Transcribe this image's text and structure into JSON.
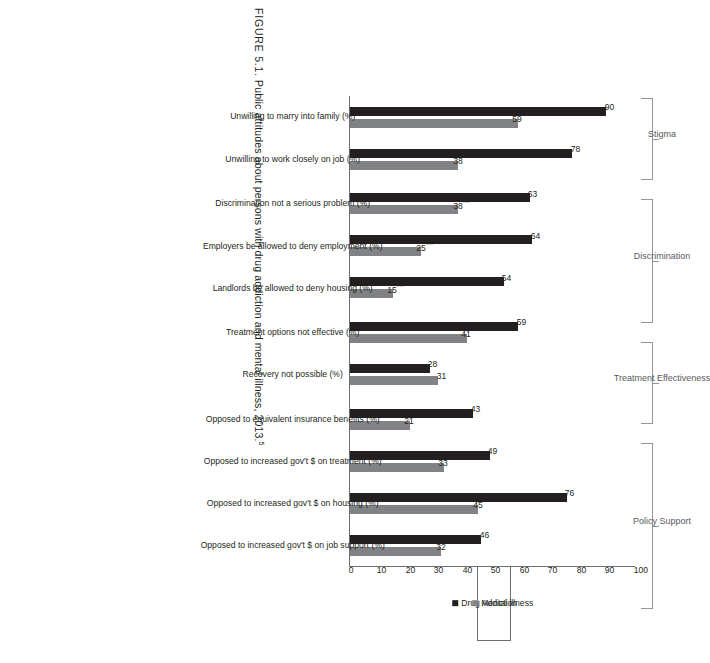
{
  "caption": {
    "figure_number": "FIGURE 5.1.",
    "text": "Public attitudes about persons with drug addiction and mental illness, 2013.",
    "footnote_marker": "5"
  },
  "legend": {
    "items": [
      {
        "label": "Drug Addiction",
        "color": "#231f20",
        "key": "drug"
      },
      {
        "label": "Mental illness",
        "color": "#808285",
        "key": "mi"
      }
    ]
  },
  "axis": {
    "ticks": [
      "0",
      "10",
      "20",
      "30",
      "40",
      "50",
      "60",
      "70",
      "80",
      "90",
      "100"
    ]
  },
  "brackets": [
    {
      "label": "Stigma"
    },
    {
      "label": "Discrimination"
    },
    {
      "label": "Treatment Effectiveness"
    },
    {
      "label": "Policy Support"
    }
  ],
  "groups": [
    {
      "name": "Stigma",
      "categories": [
        {
          "label": "Unwilling to marry into family (%)",
          "drug": {
            "value": 90,
            "display": "90",
            "stars": ""
          },
          "mi": {
            "value": 59,
            "display": "59",
            "stars": "***"
          }
        },
        {
          "label": "Unwilling to work closely on job (%)",
          "drug": {
            "value": 78,
            "display": "78",
            "stars": ""
          },
          "mi": {
            "value": 38,
            "display": "38",
            "stars": "***"
          }
        }
      ]
    },
    {
      "name": "Discrimination",
      "categories": [
        {
          "label": "Discrimination not a serious problem (%)",
          "drug": {
            "value": 63,
            "display": "63",
            "stars": ""
          },
          "mi": {
            "value": 38,
            "display": "38",
            "stars": "***"
          }
        },
        {
          "label": "Employers be allowed to deny employment (%)",
          "drug": {
            "value": 64,
            "display": "64",
            "stars": ""
          },
          "mi": {
            "value": 25,
            "display": "25",
            "stars": "***"
          }
        },
        {
          "label": "Landlords be allowed to deny housing (%)",
          "drug": {
            "value": 54,
            "display": "54",
            "stars": ""
          },
          "mi": {
            "value": 15,
            "display": "15",
            "stars": "***"
          }
        }
      ]
    },
    {
      "name": "Treatment Effectiveness",
      "categories": [
        {
          "label": "Treatment options not effective (%)",
          "drug": {
            "value": 59,
            "display": "59",
            "stars": ""
          },
          "mi": {
            "value": 41,
            "display": "41",
            "stars": "***"
          }
        },
        {
          "label": "Recovery not possible (%)",
          "drug": {
            "value": 28,
            "display": "28",
            "stars": ""
          },
          "mi": {
            "value": 31,
            "display": "31",
            "stars": ""
          }
        }
      ]
    },
    {
      "name": "Policy Support",
      "categories": [
        {
          "label": "Opposed to equivalent insurance benefits (%)",
          "drug": {
            "value": 43,
            "display": "43",
            "stars": ""
          },
          "mi": {
            "value": 21,
            "display": "21",
            "stars": "***"
          }
        },
        {
          "label": "Opposed to increased gov't $ on treatment (%)",
          "drug": {
            "value": 49,
            "display": "49",
            "stars": ""
          },
          "mi": {
            "value": 33,
            "display": "33",
            "stars": "***"
          }
        },
        {
          "label": "Opposed to increased gov't $ on housing (%)",
          "drug": {
            "value": 76,
            "display": "76",
            "stars": ""
          },
          "mi": {
            "value": 45,
            "display": "45",
            "stars": "***"
          }
        },
        {
          "label": "Opposed to increased gov't $ on job support (%)",
          "drug": {
            "value": 46,
            "display": "46",
            "stars": ""
          },
          "mi": {
            "value": 32,
            "display": "32",
            "stars": "***"
          }
        }
      ]
    }
  ],
  "chart_data": {
    "type": "bar",
    "title": "Public attitudes about persons with drug addiction and mental illness, 2013.",
    "xlabel": "",
    "ylabel": "",
    "ylim": [
      0,
      100
    ],
    "grid": false,
    "legend_position": "right",
    "orientation": "vertical",
    "categories": [
      "Unwilling to marry into family (%)",
      "Unwilling to work closely on job (%)",
      "Discrimination not a serious problem (%)",
      "Employers be allowed to deny employment (%)",
      "Landlords be allowed to deny housing (%)",
      "Treatment options not effective (%)",
      "Recovery not possible (%)",
      "Opposed to equivalent insurance benefits (%)",
      "Opposed to increased gov't $ on treatment (%)",
      "Opposed to increased gov't $ on housing (%)",
      "Opposed to increased gov't $ on job support (%)"
    ],
    "category_groups": [
      {
        "name": "Stigma",
        "categories": [
          0,
          1
        ]
      },
      {
        "name": "Discrimination",
        "categories": [
          2,
          3,
          4
        ]
      },
      {
        "name": "Treatment Effectiveness",
        "categories": [
          5,
          6
        ]
      },
      {
        "name": "Policy Support",
        "categories": [
          7,
          8,
          9,
          10
        ]
      }
    ],
    "series": [
      {
        "name": "Drug Addiction",
        "color": "#231f20",
        "values": [
          90,
          78,
          63,
          64,
          54,
          59,
          28,
          43,
          49,
          76,
          46
        ]
      },
      {
        "name": "Mental illness",
        "color": "#808285",
        "values": [
          59,
          38,
          38,
          25,
          15,
          41,
          31,
          21,
          33,
          45,
          32
        ],
        "significance": [
          "***",
          "***",
          "***",
          "***",
          "***",
          "***",
          "",
          "***",
          "***",
          "***",
          "***"
        ]
      }
    ],
    "yticks": [
      0,
      10,
      20,
      30,
      40,
      50,
      60,
      70,
      80,
      90,
      100
    ],
    "annotations": [
      "*** denotes statistically significant difference"
    ]
  }
}
